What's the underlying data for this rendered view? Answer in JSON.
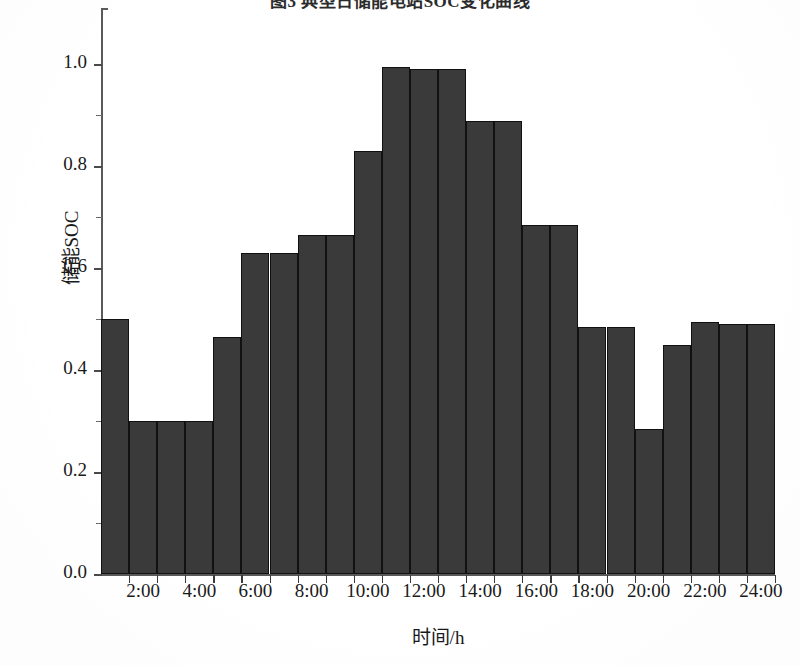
{
  "chart_data": {
    "type": "bar",
    "title": "图3 典型日储能电站SOC变化曲线",
    "xlabel": "时间/h",
    "ylabel": "储能SOC",
    "ylim": [
      0.0,
      1.0
    ],
    "grid": false,
    "legend": null,
    "categories": [
      "1:00",
      "2:00",
      "3:00",
      "4:00",
      "5:00",
      "6:00",
      "7:00",
      "8:00",
      "9:00",
      "10:00",
      "11:00",
      "12:00",
      "13:00",
      "14:00",
      "15:00",
      "16:00",
      "17:00",
      "18:00",
      "19:00",
      "20:00",
      "21:00",
      "22:00",
      "23:00",
      "24:00"
    ],
    "values": [
      0.5,
      0.3,
      0.3,
      0.3,
      0.465,
      0.63,
      0.63,
      0.665,
      0.665,
      0.83,
      0.995,
      0.99,
      0.99,
      0.888,
      0.888,
      0.685,
      0.685,
      0.485,
      0.485,
      0.285,
      0.45,
      0.495,
      0.49,
      0.49
    ],
    "y_ticks": [
      "0.0",
      "0.2",
      "0.4",
      "0.6",
      "0.8",
      "1.0"
    ],
    "y_tick_values": [
      0.0,
      0.2,
      0.4,
      0.6,
      0.8,
      1.0
    ],
    "y_minor_tick_values": [
      0.1,
      0.3,
      0.5,
      0.7,
      0.9
    ],
    "x_tick_labels": [
      "2:00",
      "4:00",
      "6:00",
      "8:00",
      "10:00",
      "12:00",
      "14:00",
      "16:00",
      "18:00",
      "20:00",
      "22:00",
      "24:00"
    ],
    "bar_color": "#3a3a3a",
    "bar_edge_color": "#111111",
    "axis_color": "#5a5a5a",
    "background_color": "#ffffff"
  }
}
